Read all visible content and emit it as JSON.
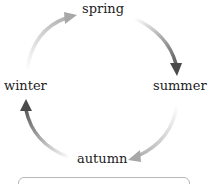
{
  "diagram": {
    "type": "cycle",
    "nodes": [
      {
        "id": "spring",
        "label": "spring"
      },
      {
        "id": "summer",
        "label": "summer"
      },
      {
        "id": "autumn",
        "label": "autumn"
      },
      {
        "id": "winter",
        "label": "winter"
      }
    ],
    "edges": [
      {
        "from": "spring",
        "to": "summer",
        "color": "#4a4a4a"
      },
      {
        "from": "summer",
        "to": "autumn",
        "color": "#a8a8a8"
      },
      {
        "from": "autumn",
        "to": "winter",
        "color": "#4a4a4a"
      },
      {
        "from": "winter",
        "to": "spring",
        "color": "#a8a8a8"
      }
    ]
  },
  "answer_box": {
    "text": ""
  }
}
